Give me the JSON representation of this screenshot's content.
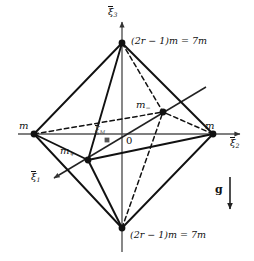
{
  "figure": {
    "name": "octahedron-mass-configuration-diagram",
    "background_color": "#ffffff",
    "line_color": "#111111",
    "axis_color": "#555555",
    "width": 254,
    "height": 261
  },
  "axes": {
    "vertical": {
      "name": "xi3-axis",
      "label_xi": "ξ",
      "label_sub": "3",
      "label_full": "ξ̅3",
      "x": 122,
      "y_top": 20,
      "y_bottom": 252,
      "arrow": "up"
    },
    "horizontal": {
      "name": "xi2-axis",
      "label_xi": "ξ",
      "label_sub": "2",
      "label_full": "ξ̅2",
      "y": 134,
      "x_left": 18,
      "x_right": 242,
      "arrow": "right"
    },
    "oblique": {
      "name": "xi1-axis",
      "label_xi": "ξ",
      "label_sub": "1",
      "label_full": "ξ̅1",
      "x_start": 206,
      "y_start": 87,
      "x_end": 52,
      "y_end": 179,
      "arrow": "down-left"
    }
  },
  "origin": {
    "label": "0",
    "x": 122,
    "y": 134
  },
  "center_of_mass": {
    "name": "xi-M-point",
    "label_xi": "ξ",
    "label_sub": "M",
    "label_full": "ξ̅M",
    "x": 107,
    "y": 140
  },
  "vertices": [
    {
      "id": "top",
      "label": "(2r − 1)m = 7m",
      "label_plain": "(2r-1)m = 7m",
      "x": 122,
      "y": 43,
      "label_x": 131,
      "label_y": 36
    },
    {
      "id": "bottom",
      "label": "(2r − 1)m = 7m",
      "label_plain": "(2r-1)m = 7m",
      "x": 122,
      "y": 228,
      "label_x": 130,
      "label_y": 230
    },
    {
      "id": "left",
      "label": "m",
      "x": 34,
      "y": 134,
      "label_x": 19,
      "label_y": 121
    },
    {
      "id": "right",
      "label": "m",
      "x": 213,
      "y": 134,
      "label_x": 205,
      "label_y": 121
    },
    {
      "id": "front",
      "label": "m₊",
      "label_base": "m",
      "label_sub": "+",
      "x": 88,
      "y": 160,
      "label_x": 60,
      "label_y": 146
    },
    {
      "id": "back",
      "label": "m₋",
      "label_base": "m",
      "label_sub": "−",
      "x": 163,
      "y": 112,
      "label_x": 136,
      "label_y": 100
    }
  ],
  "gravity": {
    "name": "gravity-vector",
    "label": "g",
    "label_x": 216,
    "label_y": 190,
    "arrow_x": 230,
    "arrow_y_top": 177,
    "arrow_y_bottom": 213
  },
  "edges": {
    "solid": [
      [
        "top",
        "left"
      ],
      [
        "top",
        "right"
      ],
      [
        "top",
        "front"
      ],
      [
        "bottom",
        "left"
      ],
      [
        "bottom",
        "right"
      ],
      [
        "bottom",
        "front"
      ],
      [
        "left",
        "front"
      ],
      [
        "right",
        "front"
      ]
    ],
    "dashed": [
      [
        "top",
        "back"
      ],
      [
        "bottom",
        "back"
      ],
      [
        "left",
        "back"
      ],
      [
        "right",
        "back"
      ]
    ]
  }
}
